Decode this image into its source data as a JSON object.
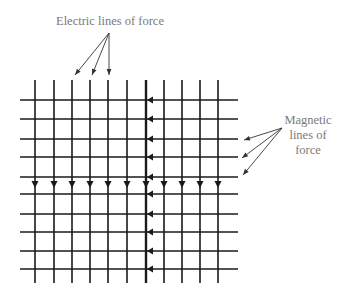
{
  "labels": {
    "electric": "Electric lines of force",
    "magnetic": [
      "Magnetic",
      "lines of",
      "force"
    ]
  },
  "grid": {
    "vertical_x": [
      35,
      54,
      72,
      90,
      108,
      127,
      146,
      164,
      182,
      200,
      218
    ],
    "horizontal_y": [
      100,
      119,
      139,
      157,
      177,
      194,
      214,
      232,
      251,
      269
    ],
    "vertical_top": 80,
    "vertical_bottom": 283,
    "horizontal_left": 20,
    "horizontal_right": 238,
    "down_arrow_y": 188,
    "left_arrow_x": 147,
    "thick_vertical_index": 6
  },
  "pointers": {
    "electric": {
      "origin": [
        109,
        33
      ],
      "tips": [
        [
          75,
          75
        ],
        [
          92,
          75
        ],
        [
          109,
          75
        ]
      ]
    },
    "magnetic": {
      "origin": [
        282,
        128
      ],
      "tips": [
        [
          244,
          140
        ],
        [
          242,
          158
        ],
        [
          243,
          175
        ]
      ]
    }
  },
  "colors": {
    "line": "#1a1a1a",
    "pointer": "#333333",
    "text": "#7a7a7a"
  }
}
